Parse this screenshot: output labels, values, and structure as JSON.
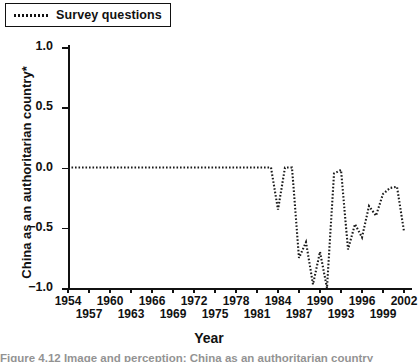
{
  "legend": {
    "entries": [
      {
        "label": "Survey questions",
        "style": "dotted",
        "color": "#1a1a1a"
      }
    ]
  },
  "axes": {
    "y_title": "China as an authoritarian country*",
    "x_title": "Year"
  },
  "caption": "Figure 4.12   Image and perception: China as an authoritarian country",
  "chart_data": {
    "type": "line",
    "title": "",
    "subtitle": "",
    "xlabel": "Year",
    "ylabel": "China as an authoritarian country*",
    "grid": false,
    "legend_position": "top-left",
    "xlim": [
      1954,
      2003
    ],
    "ylim": [
      -1.0,
      1.0
    ],
    "ytick_labels": [
      "1.0",
      "0.5",
      "0.0",
      "-0.5",
      "-1.0"
    ],
    "ytick_values": [
      1.0,
      0.5,
      0.0,
      -0.5,
      -1.0
    ],
    "xtick_labels_top": [
      "1954",
      "1960",
      "1966",
      "1972",
      "1978",
      "1984",
      "1990",
      "1996",
      "2002"
    ],
    "xtick_values_top": [
      1954,
      1960,
      1966,
      1972,
      1978,
      1984,
      1990,
      1996,
      2002
    ],
    "xtick_labels_bottom": [
      "1957",
      "1963",
      "1969",
      "1975",
      "1981",
      "1987",
      "1993",
      "1999"
    ],
    "xtick_values_bottom": [
      1957,
      1963,
      1969,
      1975,
      1981,
      1987,
      1993,
      1999
    ],
    "series": [
      {
        "name": "Survey questions",
        "style": "dotted",
        "color": "#1a1a1a",
        "x": [
          1954,
          1955,
          1956,
          1957,
          1958,
          1959,
          1960,
          1961,
          1962,
          1963,
          1964,
          1965,
          1966,
          1967,
          1968,
          1969,
          1970,
          1971,
          1972,
          1973,
          1974,
          1975,
          1976,
          1977,
          1978,
          1979,
          1980,
          1981,
          1982,
          1983,
          1984,
          1985,
          1986,
          1987,
          1988,
          1989,
          1990,
          1991,
          1992,
          1993,
          1994,
          1995,
          1996,
          1997,
          1998,
          1999,
          2000,
          2001,
          2002
        ],
        "values": [
          0.0,
          0.0,
          0.0,
          0.0,
          0.0,
          0.0,
          0.0,
          0.0,
          0.0,
          0.0,
          0.0,
          0.0,
          0.0,
          0.0,
          0.0,
          0.0,
          0.0,
          0.0,
          0.0,
          0.0,
          0.0,
          0.0,
          0.0,
          0.0,
          0.0,
          0.0,
          0.0,
          0.0,
          0.0,
          0.0,
          -0.35,
          0.0,
          0.0,
          -0.75,
          -0.62,
          -0.97,
          -0.7,
          -1.0,
          -0.05,
          -0.02,
          -0.68,
          -0.47,
          -0.58,
          -0.32,
          -0.4,
          -0.22,
          -0.17,
          -0.16,
          -0.53
        ]
      }
    ]
  }
}
